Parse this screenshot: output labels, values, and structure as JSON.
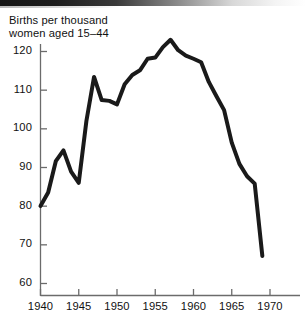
{
  "figure": {
    "title_line1": "Births per thousand",
    "title_line2": "women aged 15–44",
    "title": "Births per thousand\nwomen aged 15–44",
    "line_color": "#1a1a1a",
    "axis_color": "#6b6b6b",
    "background_color": "#ffffff",
    "artifact": "scan-edge-strip"
  },
  "chart_data": {
    "type": "line",
    "title": "Births per thousand women aged 15–44",
    "subtitle": "",
    "xlabel": "",
    "ylabel": "Births per thousand women aged 15–44",
    "xlim": [
      1940,
      1971
    ],
    "ylim": [
      57,
      125
    ],
    "grid": false,
    "legend": false,
    "legend_position": "none",
    "xticks": [
      1940,
      1945,
      1950,
      1955,
      1960,
      1965,
      1970
    ],
    "xtick_labels": [
      "1940",
      "1945",
      "1950",
      "1955",
      "1960",
      "1965",
      "1970"
    ],
    "yticks": [
      60,
      70,
      80,
      90,
      100,
      110,
      120
    ],
    "ytick_labels": [
      "60",
      "70",
      "80",
      "90",
      "100",
      "110",
      "120"
    ],
    "series": [
      {
        "name": "Births per thousand women aged 15-44",
        "x": [
          1940,
          1941,
          1942,
          1943,
          1944,
          1945,
          1946,
          1947,
          1948,
          1949,
          1950,
          1951,
          1952,
          1953,
          1954,
          1955,
          1956,
          1957,
          1958,
          1959,
          1960,
          1961,
          1962,
          1963,
          1964,
          1965,
          1966,
          1967,
          1968,
          1969
        ],
        "values": [
          79.9,
          83.4,
          91.5,
          94.3,
          88.8,
          85.9,
          101.9,
          113.3,
          107.3,
          107.1,
          106.2,
          111.4,
          113.8,
          115.0,
          118.0,
          118.3,
          121.0,
          122.9,
          120.2,
          118.8,
          118.0,
          117.1,
          112.0,
          108.3,
          104.7,
          96.3,
          90.8,
          87.6,
          85.7,
          67.0
        ],
        "color": "#1a1a1a",
        "linewidth": 4
      }
    ],
    "annotations": [
      {
        "label": "wartime peak",
        "x": 1943,
        "y": 94.3
      },
      {
        "label": "postwar spike",
        "x": 1947,
        "y": 113.3
      },
      {
        "label": "baby-boom peak",
        "x": 1957,
        "y": 122.9
      },
      {
        "label": "end of series low",
        "x": 1969,
        "y": 67.0
      }
    ]
  }
}
